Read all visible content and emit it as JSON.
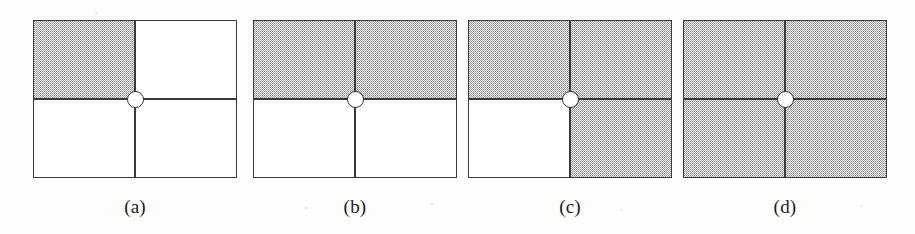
{
  "figure": {
    "background_color": "#fdfdfb",
    "line_color": "#3a3a3a",
    "shade_color": "#d9d9d9",
    "hub_fill_color": "#ffffff",
    "panel_count": 4,
    "panel_width": 204,
    "panel_height": 158,
    "panel_top": 20,
    "label_top": 196,
    "panels": [
      {
        "id": "panel-a",
        "label": "(a)",
        "left": 33,
        "shaded_quadrants": [
          "top-left"
        ],
        "quadrants": {
          "top-left": "shaded",
          "top-right": "unshaded",
          "bottom-left": "unshaded",
          "bottom-right": "unshaded"
        },
        "shaded_count": 1
      },
      {
        "id": "panel-b",
        "label": "(b)",
        "left": 253,
        "shaded_quadrants": [
          "top-left",
          "top-right"
        ],
        "quadrants": {
          "top-left": "shaded",
          "top-right": "shaded",
          "bottom-left": "unshaded",
          "bottom-right": "unshaded"
        },
        "shaded_count": 2
      },
      {
        "id": "panel-c",
        "label": "(c)",
        "left": 468,
        "shaded_quadrants": [
          "top-left",
          "top-right",
          "bottom-right"
        ],
        "quadrants": {
          "top-left": "shaded",
          "top-right": "shaded",
          "bottom-left": "unshaded",
          "bottom-right": "shaded"
        },
        "shaded_count": 3
      },
      {
        "id": "panel-d",
        "label": "(d)",
        "left": 683,
        "shaded_quadrants": [
          "top-left",
          "top-right",
          "bottom-left",
          "bottom-right"
        ],
        "quadrants": {
          "top-left": "shaded",
          "top-right": "shaded",
          "bottom-left": "shaded",
          "bottom-right": "shaded"
        },
        "shaded_count": 4
      }
    ]
  }
}
